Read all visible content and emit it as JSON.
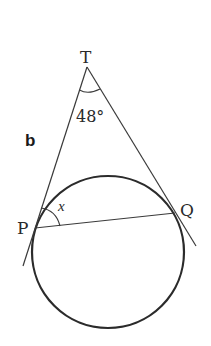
{
  "figure": {
    "part_label": "b",
    "points": {
      "T": {
        "label": "T",
        "x": 87,
        "y": 67
      },
      "P": {
        "label": "P",
        "x": 35,
        "y": 228
      },
      "Q": {
        "label": "Q",
        "x": 175,
        "y": 213
      }
    },
    "angle_at_T": {
      "label": "48°",
      "value": 48
    },
    "unknown_angle": {
      "label": "x",
      "at": "P",
      "between": [
        "tangent PT",
        "chord PQ"
      ]
    },
    "circle": {
      "cx": 108,
      "cy": 252,
      "r": 76
    },
    "tangents": [
      "TP",
      "TQ"
    ],
    "chord": "PQ",
    "colors": {
      "stroke": "#2b2b2b",
      "background": "#ffffff"
    }
  }
}
